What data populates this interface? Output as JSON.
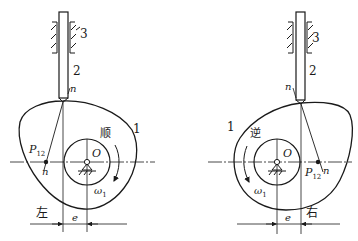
{
  "figures": [
    {
      "id": "left",
      "cam_label": "1",
      "follower_label": "2",
      "frame_label": "3",
      "normal_label": "n",
      "normal_label_lower": "n",
      "pivot_label": "O",
      "instant_center_main": "P",
      "instant_center_sub": "12",
      "rotation_direction": "顺",
      "angular_velocity_main": "ω",
      "angular_velocity_sub": "1",
      "offset_label": "e",
      "offset_side": "左"
    },
    {
      "id": "right",
      "cam_label": "1",
      "follower_label": "2",
      "frame_label": "3",
      "normal_label": "n",
      "normal_label_lower": "n",
      "pivot_label": "O",
      "instant_center_main": "P",
      "instant_center_sub": "12",
      "rotation_direction": "逆",
      "angular_velocity_main": "ω",
      "angular_velocity_sub": "1",
      "offset_label": "e",
      "offset_side": "右"
    }
  ],
  "colors": {
    "ink": "#1a1a1a",
    "background": "#ffffff"
  }
}
